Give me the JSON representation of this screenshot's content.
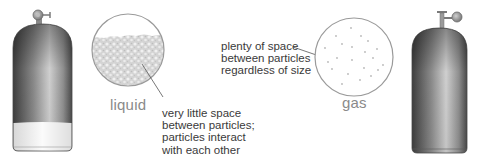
{
  "diagram": {
    "liquid": {
      "state_label": "liquid",
      "caption_lines": [
        "very little space",
        "between particles;",
        "particles interact",
        "with each other"
      ]
    },
    "gas": {
      "state_label": "gas",
      "caption_lines": [
        "plenty of space",
        "between particles",
        "regardless of size"
      ]
    },
    "colors": {
      "cylinder_dark": "#4a4a4a",
      "cylinder_light": "#c8c8c8",
      "liquid_fill": "#d9d9d9",
      "circle_outline": "#9a9a9a",
      "caption_text": "#3a3a3a",
      "label_text": "#8a8a8a"
    }
  }
}
